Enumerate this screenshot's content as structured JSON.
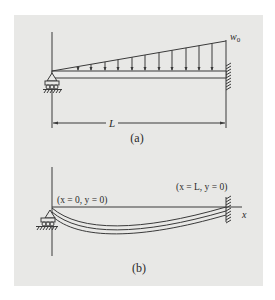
{
  "figure": {
    "background": "#e8e8e6",
    "stroke_color": "#3a3a3a",
    "panel_a": {
      "caption": "(a)",
      "load_label": "w",
      "load_label_sub": "0",
      "length_label": "L",
      "load_type": "linearly increasing distributed load",
      "left_support": "pin/roller support",
      "right_support": "fixed wall",
      "arrow_count": 11
    },
    "panel_b": {
      "caption": "(b)",
      "left_bc_label": "(x = 0, y = 0)",
      "right_bc_label": "(x = L, y = 0)",
      "axis_label": "x",
      "beam_state": "deflected elastic curve"
    }
  }
}
